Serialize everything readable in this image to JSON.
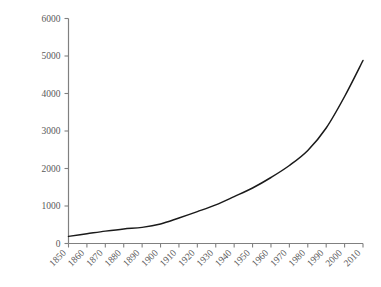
{
  "chart_data": {
    "type": "line",
    "title": "",
    "xlabel": "",
    "ylabel": "million troy oz.",
    "xlim": [
      1850,
      2010
    ],
    "ylim": [
      0,
      6000
    ],
    "grid": false,
    "legend": null,
    "line_color": "#1a1a1a",
    "tick_color": "#808080",
    "text_color": "#595959",
    "ytick_labels": [
      "0",
      "1000",
      "2000",
      "3000",
      "4000",
      "5000",
      "6000"
    ],
    "ytick_values": [
      0,
      1000,
      2000,
      3000,
      4000,
      5000,
      6000
    ],
    "xtick_labels": [
      "1850",
      "1860",
      "1870",
      "1880",
      "1890",
      "1900",
      "1910",
      "1920",
      "1930",
      "1940",
      "1950",
      "1960",
      "1970",
      "1980",
      "1990",
      "2000",
      "2010"
    ],
    "x": [
      1850,
      1860,
      1870,
      1880,
      1890,
      1900,
      1910,
      1920,
      1930,
      1940,
      1950,
      1960,
      1970,
      1980,
      1990,
      2000,
      2010
    ],
    "values": [
      190,
      260,
      330,
      390,
      430,
      520,
      680,
      850,
      1030,
      1250,
      1480,
      1760,
      2080,
      2480,
      3080,
      3920,
      4880
    ],
    "series": [
      {
        "name": "million troy oz.",
        "values": [
          190,
          260,
          330,
          390,
          430,
          520,
          680,
          850,
          1030,
          1250,
          1480,
          1760,
          2080,
          2480,
          3080,
          3920,
          4880
        ]
      }
    ]
  }
}
